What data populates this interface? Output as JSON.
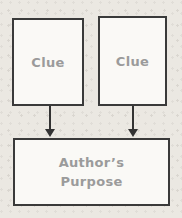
{
  "diagram": {
    "clue_left": {
      "label": "Clue"
    },
    "clue_right": {
      "label": "Clue"
    },
    "purpose": {
      "label_line1": "Author’s",
      "label_line2": "Purpose"
    }
  },
  "colors": {
    "paper_background": "#ebe8e2",
    "box_fill": "#faf9f6",
    "box_border": "#3a3a3a",
    "label_text": "#9b9b9b",
    "arrow": "#333333"
  }
}
